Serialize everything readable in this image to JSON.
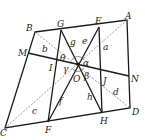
{
  "diagram": {
    "type": "geometry-figure",
    "points": {
      "A": {
        "label": "A",
        "x": 127,
        "y": 20
      },
      "B": {
        "label": "B",
        "x": 35,
        "y": 32
      },
      "C": {
        "label": "C",
        "x": 5,
        "y": 128
      },
      "D": {
        "label": "D",
        "x": 130,
        "y": 108
      },
      "E": {
        "label": "E",
        "x": 99,
        "y": 27
      },
      "G": {
        "label": "G",
        "x": 61,
        "y": 30
      },
      "F": {
        "label": "F",
        "x": 48,
        "y": 122
      },
      "H": {
        "label": "H",
        "x": 102,
        "y": 113
      },
      "M": {
        "label": "M",
        "x": 28,
        "y": 53
      },
      "N": {
        "label": "N",
        "x": 129,
        "y": 76
      },
      "O": {
        "label": "O",
        "x": 78,
        "y": 64
      }
    },
    "segment_labels": {
      "a": "a",
      "b": "b",
      "c": "c",
      "d": "d",
      "e": "e",
      "f": "f",
      "g": "g",
      "h": "h",
      "I": "I",
      "J": "J"
    },
    "angle_labels": {
      "alpha": "α",
      "beta": "β",
      "gamma": "γ",
      "theta": "θ"
    }
  }
}
